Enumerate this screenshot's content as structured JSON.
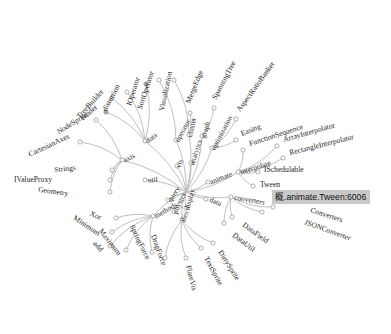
{
  "app": {
    "title": "Flare Class Hierarchy - Radial Dendrogram",
    "background_color": "#ffffff",
    "link_color": "#b9b9b9",
    "node_stroke_color": "#9a9a9a",
    "node_fill_color": "#ffffff",
    "node_highlight_fill": "#a8a8a8",
    "label_color": "#1d1d1d"
  },
  "tooltip": {
    "text": "概.animate.Tween:6006",
    "background_color": "#c9c9c9",
    "text_color": "#101010",
    "x": 272,
    "y": 190,
    "visible": true
  },
  "chart_data": {
    "type": "tree",
    "layout": "radial-dendrogram",
    "center": {
      "x": 186,
      "y": 192
    },
    "root": "flare",
    "inner_nodes": [
      {
        "id": "operator",
        "label": "operator",
        "x": 176,
        "y": 140,
        "angle": -100,
        "r": 53,
        "rotate": -62
      },
      {
        "id": "vis",
        "label": "vis",
        "x": 177,
        "y": 166,
        "angle": -95,
        "r": 27,
        "rotate": -70
      },
      {
        "id": "data",
        "label": "data-left",
        "x": 145,
        "y": 141,
        "angle": -128,
        "r": 66,
        "rotate": -38,
        "text": "data"
      },
      {
        "id": "axis",
        "label": "axis",
        "x": 122,
        "y": 160,
        "angle": -148,
        "r": 73,
        "rotate": -26
      },
      {
        "id": "cluster",
        "label": "cluster",
        "x": 189,
        "y": 135,
        "angle": -88,
        "r": 57,
        "rotate": -78
      },
      {
        "id": "graph",
        "label": "graph",
        "x": 202,
        "y": 136,
        "angle": -78,
        "r": 58,
        "rotate": -72
      },
      {
        "id": "analytics",
        "label": "analytics",
        "x": 191,
        "y": 163,
        "angle": -83,
        "r": 30,
        "rotate": -72
      },
      {
        "id": "optimization",
        "label": "optimization",
        "x": 212,
        "y": 148,
        "angle": -62,
        "r": 52,
        "rotate": -62
      },
      {
        "id": "animate",
        "label": "animate",
        "x": 208,
        "y": 182,
        "angle": -25,
        "r": 24,
        "rotate": -22
      },
      {
        "id": "interpolate",
        "label": "interpolate",
        "x": 238,
        "y": 172,
        "angle": -21,
        "r": 55,
        "rotate": -18
      },
      {
        "id": "converters",
        "label": "converters",
        "x": 231,
        "y": 197,
        "angle": 6,
        "r": 45,
        "rotate": 10
      },
      {
        "id": "data_r",
        "label": "data-right",
        "x": 206,
        "y": 199,
        "angle": 18,
        "r": 21,
        "rotate": 22,
        "text": "data"
      },
      {
        "id": "util",
        "label": "util",
        "x": 145,
        "y": 180,
        "angle": 194,
        "r": 43,
        "rotate": -4
      },
      {
        "id": "query",
        "label": "query",
        "x": 168,
        "y": 200,
        "angle": 160,
        "r": 20,
        "rotate": -56
      },
      {
        "id": "methods",
        "label": "methods",
        "x": 153,
        "y": 216,
        "angle": 150,
        "r": 41,
        "rotate": -30
      },
      {
        "id": "physics",
        "label": "physics",
        "x": 174,
        "y": 212,
        "angle": 120,
        "r": 23,
        "rotate": -66
      },
      {
        "id": "display",
        "label": "display",
        "x": 186,
        "y": 208,
        "angle": 95,
        "r": 18,
        "rotate": -74
      },
      {
        "id": "flex",
        "label": "flex",
        "x": 182,
        "y": 220,
        "angle": 100,
        "r": 30,
        "rotate": -70
      }
    ],
    "leaf_nodes": [
      {
        "label": "SortOperator",
        "nx": 159,
        "ny": 80,
        "lx": 154,
        "ly": 72,
        "rotate": -72
      },
      {
        "label": "IOperator",
        "nx": 146,
        "ny": 84,
        "lx": 140,
        "ly": 78,
        "rotate": -72,
        "highlight": true
      },
      {
        "label": "Visualization",
        "nx": 174,
        "ny": 80,
        "lx": 172,
        "ly": 72,
        "rotate": -78
      },
      {
        "label": "distortion",
        "nx": 127,
        "ny": 92,
        "lx": 120,
        "ly": 86,
        "rotate": -62
      },
      {
        "label": "TreeBuilder",
        "nx": 112,
        "ny": 98,
        "lx": 104,
        "ly": 92,
        "rotate": -48
      },
      {
        "label": "render",
        "nx": 106,
        "ny": 112,
        "lx": 98,
        "ly": 108,
        "rotate": -40,
        "highlight": true
      },
      {
        "label": "NodeSprite",
        "nx": 96,
        "ny": 120,
        "lx": 88,
        "ly": 116,
        "rotate": -32
      },
      {
        "label": "CartesianAxes",
        "nx": 80,
        "ny": 142,
        "lx": 70,
        "ly": 138,
        "rotate": -25
      },
      {
        "label": "MergeEdge",
        "nx": 190,
        "ny": 113,
        "lx": 190,
        "ly": 104,
        "rotate": -68
      },
      {
        "label": "SpanningTree",
        "nx": 214,
        "ny": 108,
        "lx": 216,
        "ly": 100,
        "rotate": -62
      },
      {
        "label": "AspectRatioBanker",
        "nx": 236,
        "ny": 119,
        "lx": 240,
        "ly": 112,
        "rotate": -54
      },
      {
        "label": "Easing",
        "nx": 236,
        "ny": 140,
        "lx": 242,
        "ly": 136,
        "rotate": -22
      },
      {
        "label": "FunctionSequence",
        "nx": 243,
        "ny": 150,
        "lx": 250,
        "ly": 146,
        "rotate": -18
      },
      {
        "label": "ArrayInterpolator",
        "nx": 277,
        "ny": 146,
        "lx": 284,
        "ly": 142,
        "rotate": -16
      },
      {
        "label": "RectangleInterpolator",
        "nx": 283,
        "ny": 158,
        "lx": 290,
        "ly": 155,
        "rotate": -14
      },
      {
        "label": "ISchedulable",
        "nx": 258,
        "ny": 172,
        "lx": 264,
        "ly": 172,
        "rotate": 0
      },
      {
        "label": "Tween",
        "nx": 253,
        "ny": 186,
        "lx": 260,
        "ly": 187,
        "rotate": 0
      },
      {
        "label": "Converters",
        "nx": 273,
        "ny": 207,
        "lx": 310,
        "ly": 212,
        "rotate": 18
      },
      {
        "label": "JSONConverter",
        "nx": 262,
        "ny": 212,
        "lx": 304,
        "ly": 224,
        "rotate": 20
      },
      {
        "label": "DataField",
        "nx": 232,
        "ny": 217,
        "lx": 242,
        "ly": 226,
        "rotate": 36
      },
      {
        "label": "DataUtil",
        "nx": 224,
        "ny": 223,
        "lx": 232,
        "ly": 236,
        "rotate": 38
      },
      {
        "label": "DirtySprite",
        "nx": 213,
        "ny": 243,
        "lx": 218,
        "ly": 252,
        "rotate": 58
      },
      {
        "label": "TextSprite",
        "nx": 201,
        "ny": 248,
        "lx": 204,
        "ly": 258,
        "rotate": 62
      },
      {
        "label": "FlareVis",
        "nx": 186,
        "ny": 258,
        "lx": 186,
        "ly": 266,
        "rotate": 76
      },
      {
        "label": "DragForce",
        "nx": 165,
        "ny": 258,
        "lx": 162,
        "ly": 266,
        "rotate": 70
      },
      {
        "label": "SpringForce",
        "nx": 152,
        "ny": 252,
        "lx": 146,
        "ly": 260,
        "rotate": 64
      },
      {
        "label": "Maximum",
        "nx": 126,
        "ny": 250,
        "lx": 118,
        "ly": 256,
        "rotate": 52
      },
      {
        "label": "add",
        "nx": 110,
        "ny": 246,
        "lx": 100,
        "ly": 252,
        "rotate": 48
      },
      {
        "label": "Minimum",
        "nx": 112,
        "ny": 232,
        "lx": 98,
        "ly": 236,
        "rotate": 34
      },
      {
        "label": "Xor",
        "nx": 116,
        "ny": 218,
        "lx": 100,
        "ly": 220,
        "rotate": 24
      },
      {
        "label": "Geometry",
        "nx": 110,
        "ny": 192,
        "lx": 68,
        "ly": 196,
        "rotate": 8
      },
      {
        "label": "IValueProxy",
        "nx": 110,
        "ny": 180,
        "lx": 52,
        "ly": 182,
        "rotate": 0
      },
      {
        "label": "Strings",
        "nx": 112,
        "ny": 170,
        "lx": 76,
        "ly": 170,
        "rotate": -6
      }
    ]
  }
}
